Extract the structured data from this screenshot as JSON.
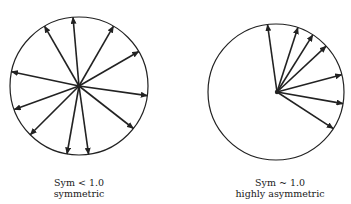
{
  "panels": [
    {
      "id": "left",
      "caption_line1": "Sym < 1.0",
      "caption_line2": "symmetric",
      "circle": {
        "cx": 79,
        "cy": 86,
        "r": 69
      },
      "arrow_angles_deg": [
        -95,
        -60,
        -120,
        -30,
        -168,
        8,
        160,
        38,
        135,
        100,
        82
      ]
    },
    {
      "id": "right",
      "caption_line1": "Sym ~ 1.0",
      "caption_line2": "highly asymmetric",
      "circle": {
        "cx": 276,
        "cy": 92,
        "r": 68
      },
      "arrow_origin": {
        "x": 277,
        "y": 92
      },
      "arrow_angles_deg": [
        -98,
        -72,
        -58,
        -43,
        -15,
        10,
        33
      ]
    }
  ],
  "colors": {
    "stroke": "#222222",
    "background": "#ffffff"
  }
}
